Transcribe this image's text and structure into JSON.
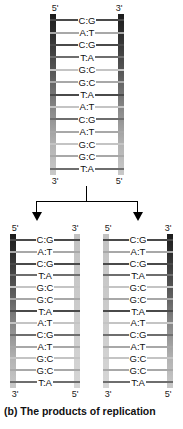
{
  "caption": "(b) The products of replication",
  "base_pairs": [
    {
      "left": "C",
      "right": "G",
      "text": "C:G"
    },
    {
      "left": "A",
      "right": "T",
      "text": "A:T"
    },
    {
      "left": "C",
      "right": "G",
      "text": "C:G"
    },
    {
      "left": "T",
      "right": "A",
      "text": "T:A"
    },
    {
      "left": "G",
      "right": "C",
      "text": "G:C"
    },
    {
      "left": "G",
      "right": "C",
      "text": "G:C"
    },
    {
      "left": "T",
      "right": "A",
      "text": "T:A"
    },
    {
      "left": "A",
      "right": "T",
      "text": "A:T"
    },
    {
      "left": "C",
      "right": "G",
      "text": "C:G"
    },
    {
      "left": "A",
      "right": "T",
      "text": "A:T"
    },
    {
      "left": "G",
      "right": "C",
      "text": "G:C"
    },
    {
      "left": "G",
      "right": "C",
      "text": "G:C"
    },
    {
      "left": "T",
      "right": "A",
      "text": "T:A"
    }
  ],
  "parent": {
    "name": "parent-dna-molecule",
    "top_left_label": "5'",
    "top_right_label": "3'",
    "bottom_left_label": "3'",
    "bottom_right_label": "5'",
    "left_strand_type": "old",
    "right_strand_type": "old"
  },
  "daughter_left": {
    "name": "daughter-dna-molecule-left",
    "top_left_label": "5'",
    "top_right_label": "3'",
    "bottom_left_label": "3'",
    "bottom_right_label": "5'",
    "left_strand_type": "old",
    "right_strand_type": "new"
  },
  "daughter_right": {
    "name": "daughter-dna-molecule-right",
    "top_left_label": "5'",
    "top_right_label": "3'",
    "bottom_left_label": "3'",
    "bottom_right_label": "5'",
    "left_strand_type": "new",
    "right_strand_type": "old"
  },
  "connector": {
    "arrow_left_icon": "down-arrow-icon",
    "arrow_right_icon": "down-arrow-icon"
  },
  "colors": {
    "old_strand_dark": "#1c1c1c",
    "old_strand_light": "#c9c9c9",
    "new_strand": "#cccccc",
    "rung": "#4a4a4a",
    "text": "#111111",
    "background": "#ffffff"
  }
}
